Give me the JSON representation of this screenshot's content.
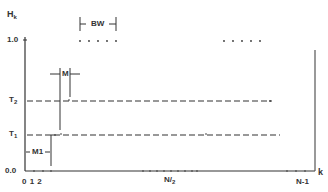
{
  "diagram": {
    "y_axis_label": "H",
    "y_axis_label_sub": "k",
    "x_axis_label": "k",
    "y_ticks": [
      {
        "label": "1.0",
        "y": 40
      },
      {
        "label": "T",
        "sub": "2",
        "y": 101
      },
      {
        "label": "T",
        "sub": "1",
        "y": 135
      },
      {
        "label": "0.0",
        "y": 171
      }
    ],
    "x_ticks": {
      "start": "0 1 2",
      "mid": "N",
      "mid_sub": "2",
      "end": "N-1"
    },
    "annotations": {
      "bw": "BW",
      "m": "M",
      "m1": "M1"
    },
    "thresholds": {
      "T1": "T1",
      "T2": "T2"
    },
    "colors": {
      "line": "#333333",
      "background": "#ffffff"
    }
  }
}
